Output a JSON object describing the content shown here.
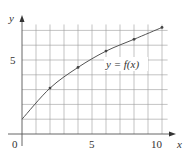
{
  "chart_data": {
    "type": "line",
    "title": "",
    "xlabel": "x",
    "ylabel": "y",
    "xlim": [
      0,
      10
    ],
    "ylim": [
      0,
      7
    ],
    "grid": true,
    "x_ticks": [
      "0",
      "5",
      "10"
    ],
    "y_ticks": [
      "5"
    ],
    "annotation": "y = f(x)",
    "series": [
      {
        "name": "y = f(x)",
        "x": [
          0,
          2,
          4,
          6,
          8,
          10
        ],
        "values": [
          1.0,
          3.1,
          4.5,
          5.6,
          6.4,
          7.2
        ],
        "marked_points_x": [
          2,
          4,
          6,
          8,
          10
        ]
      }
    ]
  },
  "labels": {
    "x_axis": "x",
    "y_axis": "y",
    "origin": "0",
    "x_tick_5": "5",
    "x_tick_10": "10",
    "y_tick_5": "5",
    "curve_label": "y = f(x)"
  }
}
